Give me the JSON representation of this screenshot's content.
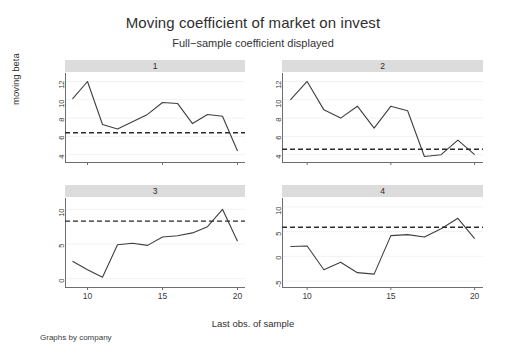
{
  "chart_data": {
    "type": "line",
    "title": "Moving coefficient of market on invest",
    "subtitle": "Full−sample coefficient displayed",
    "xlabel": "Last obs. of sample",
    "ylabel": "moving beta",
    "note": "Graphs by company",
    "grid": true,
    "legend": "none",
    "layout": "2x2 small multiples by company",
    "xlim": [
      8.5,
      20.5
    ],
    "xticks": [
      10,
      15,
      20
    ],
    "x": [
      9,
      10,
      11,
      12,
      13,
      14,
      15,
      16,
      17,
      18,
      19,
      20
    ],
    "panels": [
      {
        "id": "1",
        "label": "1",
        "ylim": [
          3.2,
          12.6
        ],
        "yticks": [
          4,
          6,
          8,
          10,
          12
        ],
        "series": [
          {
            "name": "moving beta",
            "style": "solid",
            "color": "#3f3f3f",
            "values": [
              10.1,
              12.0,
              7.3,
              6.8,
              7.6,
              8.4,
              9.7,
              9.6,
              7.4,
              8.4,
              8.2,
              4.4
            ]
          },
          {
            "name": "full-sample coefficient",
            "style": "dashed",
            "color": "#2b2b2b",
            "constant": 6.4
          }
        ]
      },
      {
        "id": "2",
        "label": "2",
        "ylim": [
          3.2,
          12.6
        ],
        "yticks": [
          4,
          6,
          8,
          10,
          12
        ],
        "series": [
          {
            "name": "moving beta",
            "style": "solid",
            "color": "#3f3f3f",
            "values": [
              10.0,
              12.0,
              8.9,
              8.0,
              9.3,
              6.9,
              9.3,
              8.8,
              3.8,
              4.0,
              5.6,
              4.0
            ]
          },
          {
            "name": "full-sample coefficient",
            "style": "dashed",
            "color": "#2b2b2b",
            "constant": 4.6
          }
        ]
      },
      {
        "id": "3",
        "label": "3",
        "ylim": [
          -1.2,
          11.2
        ],
        "yticks": [
          0,
          5,
          10
        ],
        "series": [
          {
            "name": "moving beta",
            "style": "solid",
            "color": "#3f3f3f",
            "values": [
              2.5,
              1.3,
              0.2,
              4.9,
              5.1,
              4.8,
              6.0,
              6.2,
              6.6,
              7.5,
              10.0,
              5.4
            ]
          },
          {
            "name": "full-sample coefficient",
            "style": "dashed",
            "color": "#2b2b2b",
            "constant": 8.3
          }
        ]
      },
      {
        "id": "4",
        "label": "4",
        "ylim": [
          -6.2,
          11.2
        ],
        "yticks": [
          -5,
          0,
          5,
          10
        ],
        "series": [
          {
            "name": "moving beta",
            "style": "solid",
            "color": "#3f3f3f",
            "values": [
              2.0,
              2.1,
              -2.7,
              -1.2,
              -3.3,
              -3.6,
              4.2,
              4.4,
              3.9,
              5.6,
              7.7,
              3.6
            ]
          },
          {
            "name": "full-sample coefficient",
            "style": "dashed",
            "color": "#2b2b2b",
            "constant": 5.9
          }
        ]
      }
    ]
  },
  "colors": {
    "background": "#ffffff",
    "panel_header": "#dcdcdc",
    "gridline": "#f2f2f2",
    "axis": "#6e6e6e",
    "line": "#3f3f3f",
    "reference_line": "#2b2b2b",
    "text": "#2b2b2b"
  }
}
